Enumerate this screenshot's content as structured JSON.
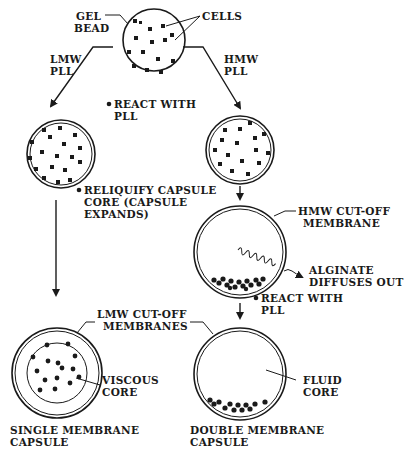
{
  "colors": {
    "ink": "#1a1a1a",
    "background": "#ffffff"
  },
  "labels": {
    "gel_bead": [
      "GEL",
      "BEAD"
    ],
    "cells": "CELLS",
    "lmw_pll": [
      "LMW",
      "PLL"
    ],
    "hmw_pll": [
      "HMW",
      "PLL"
    ],
    "react_with_pll_1": [
      "REACT WITH",
      "PLL"
    ],
    "reliquify": [
      "RELIQUIFY  CAPSULE",
      "CORE (CAPSULE",
      "EXPANDS)"
    ],
    "hmw_cutoff": [
      "HMW  CUT-OFF",
      "MEMBRANE"
    ],
    "alginate_diffuses": [
      "ALGINATE",
      "DIFFUSES  OUT"
    ],
    "react_with_pll_2": [
      "REACT  WITH",
      "PLL"
    ],
    "lmw_cutoff": [
      "LMW  CUT-OFF",
      "MEMBRANES"
    ],
    "viscous_core": [
      "VISCOUS",
      "CORE"
    ],
    "fluid_core": [
      "FLUID",
      "CORE"
    ],
    "single_membrane": [
      "SINGLE  MEMBRANE",
      "CAPSULE"
    ],
    "double_membrane": [
      "DOUBLE  MEMBRANE",
      "CAPSULE"
    ]
  },
  "nodes": [
    {
      "id": "gel-bead",
      "cx": 154,
      "cy": 40,
      "r": 31,
      "fill": "hatched",
      "membrane": false
    },
    {
      "id": "lmw-capsule",
      "cx": 61,
      "cy": 154,
      "r": 34,
      "fill": "hatched",
      "membrane": true
    },
    {
      "id": "hmw-capsule",
      "cx": 240,
      "cy": 150,
      "r": 34,
      "fill": "hatched",
      "membrane": true
    },
    {
      "id": "hmw-reliquified",
      "cx": 240,
      "cy": 252,
      "r": 44,
      "fill": "empty",
      "membrane": true
    },
    {
      "id": "single-membrane-capsule",
      "cx": 57,
      "cy": 373,
      "r": 44,
      "fill": "hatched-core",
      "membrane": "double-rim"
    },
    {
      "id": "double-membrane-capsule",
      "cx": 240,
      "cy": 374,
      "r": 46,
      "fill": "empty",
      "membrane": "double-rim"
    }
  ]
}
